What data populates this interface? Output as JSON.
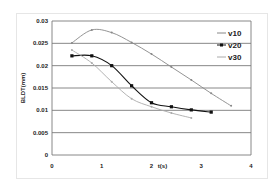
{
  "chart_data": {
    "type": "line",
    "title": "",
    "xlabel": "t(s)",
    "ylabel": "BLDT(mm)",
    "xlim": [
      0,
      4
    ],
    "ylim": [
      0,
      0.03
    ],
    "xticks": [
      "0",
      "1",
      "2",
      "3",
      "4"
    ],
    "yticks": [
      "0",
      "0.005",
      "0.01",
      "0.015",
      "0.02",
      "0.025",
      "0.03"
    ],
    "grid": "horizontal",
    "legend_position": "upper right",
    "series": [
      {
        "name": "v10",
        "color": "#888888",
        "marker": "small",
        "x": [
          0.4,
          0.8,
          1.2,
          1.6,
          2.0,
          2.4,
          2.8,
          3.2,
          3.6
        ],
        "y": [
          0.0251,
          0.028,
          0.0274,
          0.0252,
          0.0226,
          0.0197,
          0.0168,
          0.0138,
          0.011
        ]
      },
      {
        "name": "v20",
        "color": "#111111",
        "marker": "square",
        "x": [
          0.4,
          0.8,
          1.2,
          1.6,
          2.0,
          2.4,
          2.8,
          3.2
        ],
        "y": [
          0.0222,
          0.0222,
          0.02,
          0.0155,
          0.0117,
          0.0108,
          0.0101,
          0.0096
        ]
      },
      {
        "name": "v30",
        "color": "#aaaaaa",
        "marker": "small",
        "x": [
          0.4,
          0.8,
          1.2,
          1.6,
          2.0,
          2.4,
          2.8
        ],
        "y": [
          0.0235,
          0.0206,
          0.0164,
          0.0126,
          0.0108,
          0.0094,
          0.0083
        ]
      }
    ]
  }
}
